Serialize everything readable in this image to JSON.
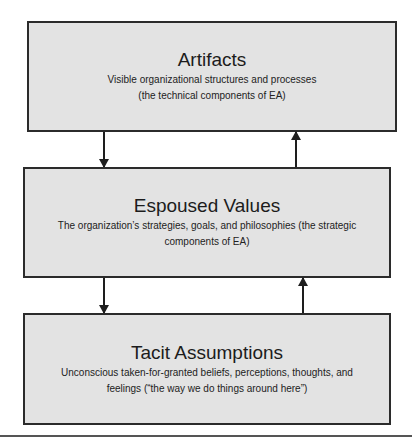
{
  "diagram": {
    "layers": [
      {
        "title": "Artifacts",
        "desc_line1": "Visible organizational structures and processes",
        "desc_line2": "(the technical components of EA)"
      },
      {
        "title": "Espoused Values",
        "desc_line1": "The organization’s strategies, goals, and philosophies (the strategic",
        "desc_line2": "components of EA)"
      },
      {
        "title": "Tacit Assumptions",
        "desc_line1": "Unconscious taken-for-granted beliefs, perceptions, thoughts, and",
        "desc_line2": "feelings (“the way we do things around here”)"
      }
    ],
    "connections": [
      {
        "from": "Artifacts",
        "to": "Espoused Values",
        "direction": "down"
      },
      {
        "from": "Espoused Values",
        "to": "Artifacts",
        "direction": "up"
      },
      {
        "from": "Espoused Values",
        "to": "Tacit Assumptions",
        "direction": "down"
      },
      {
        "from": "Tacit Assumptions",
        "to": "Espoused Values",
        "direction": "up"
      }
    ],
    "colors": {
      "box_fill": "#e3e3e3",
      "box_border": "#2b2b2b",
      "arrow": "#1e1e1e"
    }
  }
}
